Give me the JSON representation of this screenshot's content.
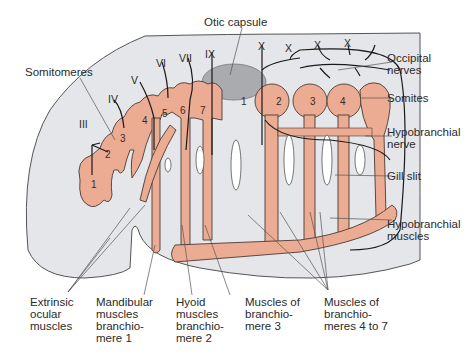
{
  "colors": {
    "background": "#ffffff",
    "body_fill": "#e4e6e9",
    "body_outline": "#555555",
    "muscle_fill": "#ecac93",
    "muscle_outline": "#4a3a34",
    "otic_fill": "#a9abae",
    "nerve": "#1a1a1a",
    "leader": "#555555"
  },
  "cranial_nerves": [
    "III",
    "IV",
    "V",
    "VI",
    "VII",
    "IX"
  ],
  "vagus_nerves": [
    "X",
    "X",
    "X",
    "X"
  ],
  "somitomere_numbers": [
    "1",
    "2",
    "3",
    "4",
    "5",
    "6",
    "7"
  ],
  "somite_numbers": [
    "1",
    "2",
    "3",
    "4"
  ],
  "labels": {
    "somitomeres": "Somitomeres",
    "otic_capsule": "Otic capsule",
    "occipital_nerves": [
      "Occipital",
      "nerves"
    ],
    "somites": "Somites",
    "hypobranchial_nerve": [
      "Hypobranchial",
      "nerve"
    ],
    "gill_slit": "Gill slit",
    "hypobranchial_muscles": [
      "Hypobranchial",
      "muscles"
    ],
    "extrinsic_ocular": [
      "Extrinsic",
      "ocular",
      "muscles"
    ],
    "mandibular": [
      "Mandibular",
      "muscles",
      "branchio-",
      "mere 1"
    ],
    "hyoid": [
      "Hyoid",
      "muscles",
      "branchio-",
      "mere 2"
    ],
    "branchiomere3": [
      "Muscles of",
      "branchio-",
      "mere 3"
    ],
    "branchiomeres4to7": [
      "Muscles of",
      "branchio-",
      "meres 4 to 7"
    ]
  }
}
